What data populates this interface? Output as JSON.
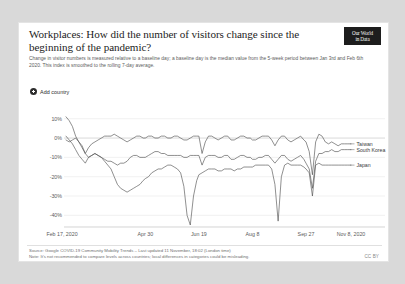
{
  "card": {
    "title": "Workplaces: How did the number of visitors change since the beginning of the pandemic?",
    "subtitle": "Change in visitor numbers is measured relative to a baseline day; a baseline day is the median value from the 5-week period between Jan 3rd and Feb 6th 2020. This index is smoothed to the rolling 7-day average.",
    "logo_line1": "Our World",
    "logo_line2": "in Data",
    "logo_icon": "owid-logo"
  },
  "controls": {
    "add_country_label": "Add country",
    "add_country_icon": "plus-circle-icon"
  },
  "footer": {
    "source": "Source: Google COVID-19 Community Mobility Trends – Last updated 11 November, 18:02 (London time)",
    "note": "Note: It's not recommended to compare levels across countries; local differences in categories could be misleading.",
    "license": "CC BY"
  },
  "chart_data": {
    "type": "line",
    "title": "Workplaces: How did the number of visitors change since the beginning of the pandemic?",
    "xlabel": "",
    "ylabel": "",
    "ylim": [
      -45,
      14
    ],
    "yticks": [
      10,
      0,
      -10,
      -20,
      -30,
      -40
    ],
    "ytick_labels": [
      "10%",
      "0%",
      "-10%",
      "-20%",
      "-30%",
      "-40%"
    ],
    "grid": true,
    "legend_position": "right-inline",
    "x_range": [
      "Feb 17, 2020",
      "Nov 8, 2020"
    ],
    "xticks": [
      0,
      74,
      124,
      174,
      224,
      266
    ],
    "xtick_labels": [
      "Feb 17, 2020",
      "Apr 30",
      "Jun 19",
      "Aug 8",
      "Sep 27",
      "Nov 8, 2020"
    ],
    "unit": "%",
    "series": [
      {
        "name": "Taiwan",
        "label_y": -3,
        "x": [
          0,
          3,
          6,
          9,
          12,
          15,
          18,
          21,
          24,
          27,
          30,
          33,
          36,
          39,
          42,
          45,
          48,
          51,
          54,
          57,
          60,
          63,
          66,
          69,
          72,
          74,
          77,
          80,
          83,
          86,
          89,
          92,
          95,
          98,
          101,
          104,
          107,
          110,
          113,
          116,
          119,
          122,
          124,
          127,
          130,
          133,
          136,
          139,
          142,
          145,
          148,
          151,
          154,
          157,
          160,
          163,
          166,
          169,
          172,
          174,
          177,
          180,
          183,
          186,
          189,
          192,
          195,
          198,
          201,
          204,
          207,
          210,
          213,
          216,
          219,
          222,
          224,
          227,
          230,
          233,
          236,
          239,
          242,
          245,
          248,
          251,
          254,
          257,
          260,
          263,
          266
        ],
        "values": [
          11,
          9,
          6,
          1,
          -2,
          -4,
          -8,
          -5,
          -3,
          -2,
          -1,
          0,
          1,
          1,
          1,
          2,
          1,
          0,
          -1,
          -2,
          -1,
          0,
          1,
          1,
          0,
          0,
          1,
          1,
          0,
          0,
          1,
          1,
          0,
          0,
          1,
          1,
          0,
          -1,
          -1,
          0,
          1,
          1,
          1,
          -8,
          -2,
          1,
          1,
          0,
          -1,
          0,
          1,
          1,
          -1,
          -1,
          0,
          1,
          1,
          0,
          0,
          -1,
          -1,
          0,
          1,
          1,
          1,
          -1,
          -4,
          -1,
          1,
          1,
          -1,
          -2,
          -1,
          0,
          1,
          -1,
          -2,
          -7,
          -19,
          -2,
          2,
          1,
          -2,
          -3,
          -2,
          -3,
          -4,
          -3,
          -3,
          -3,
          -3
        ]
      },
      {
        "name": "South Korea",
        "label_y": -6,
        "x": [
          0,
          3,
          6,
          9,
          12,
          15,
          18,
          21,
          24,
          27,
          30,
          33,
          36,
          39,
          42,
          45,
          48,
          51,
          54,
          57,
          60,
          63,
          66,
          69,
          72,
          74,
          77,
          80,
          83,
          86,
          89,
          92,
          95,
          98,
          101,
          104,
          107,
          110,
          113,
          116,
          119,
          122,
          124,
          127,
          130,
          133,
          136,
          139,
          142,
          145,
          148,
          151,
          154,
          157,
          160,
          163,
          166,
          169,
          172,
          174,
          177,
          180,
          183,
          186,
          189,
          192,
          195,
          198,
          201,
          204,
          207,
          210,
          213,
          216,
          219,
          222,
          224,
          227,
          230,
          233,
          236,
          239,
          242,
          245,
          248,
          251,
          254,
          257,
          260,
          263,
          266
        ],
        "values": [
          1,
          -1,
          -3,
          -6,
          -9,
          -11,
          -13,
          -10,
          -9,
          -8,
          -9,
          -10,
          -11,
          -12,
          -12,
          -13,
          -14,
          -13,
          -13,
          -12,
          -10,
          -9,
          -9,
          -10,
          -10,
          -10,
          -9,
          -8,
          -7,
          -7,
          -8,
          -8,
          -9,
          -9,
          -9,
          -9,
          -9,
          -10,
          -10,
          -9,
          -9,
          -9,
          -9,
          -14,
          -10,
          -9,
          -9,
          -9,
          -10,
          -10,
          -9,
          -9,
          -11,
          -11,
          -10,
          -9,
          -9,
          -10,
          -10,
          -11,
          -11,
          -10,
          -10,
          -9,
          -9,
          -11,
          -13,
          -11,
          -9,
          -9,
          -11,
          -12,
          -11,
          -10,
          -9,
          -11,
          -13,
          -16,
          -26,
          -12,
          -8,
          -8,
          -7,
          -7,
          -6,
          -7,
          -7,
          -6,
          -6,
          -6,
          -6
        ]
      },
      {
        "name": "Japan",
        "label_y": -14,
        "x": [
          0,
          3,
          6,
          9,
          12,
          15,
          18,
          21,
          24,
          27,
          30,
          33,
          36,
          39,
          42,
          45,
          48,
          51,
          54,
          57,
          60,
          63,
          66,
          69,
          72,
          74,
          77,
          80,
          83,
          86,
          89,
          92,
          95,
          98,
          101,
          104,
          107,
          110,
          113,
          116,
          119,
          122,
          124,
          127,
          130,
          133,
          136,
          139,
          142,
          145,
          148,
          151,
          154,
          157,
          160,
          163,
          166,
          169,
          172,
          174,
          177,
          180,
          183,
          186,
          189,
          192,
          195,
          198,
          201,
          204,
          207,
          210,
          213,
          216,
          219,
          222,
          224,
          227,
          230,
          233,
          236,
          239,
          242,
          245,
          248,
          251,
          254,
          257,
          260,
          263,
          266
        ],
        "values": [
          -1,
          -2,
          -1,
          0,
          -2,
          -5,
          -8,
          -10,
          -9,
          -8,
          -9,
          -10,
          -12,
          -14,
          -16,
          -20,
          -24,
          -26,
          -27,
          -28,
          -27,
          -26,
          -25,
          -24,
          -22,
          -21,
          -20,
          -18,
          -17,
          -16,
          -16,
          -15,
          -14,
          -14,
          -15,
          -16,
          -18,
          -25,
          -40,
          -45,
          -30,
          -22,
          -19,
          -18,
          -17,
          -16,
          -16,
          -16,
          -17,
          -17,
          -16,
          -16,
          -16,
          -17,
          -16,
          -16,
          -15,
          -15,
          -15,
          -15,
          -14,
          -14,
          -14,
          -14,
          -14,
          -16,
          -24,
          -43,
          -20,
          -14,
          -13,
          -14,
          -14,
          -14,
          -14,
          -15,
          -16,
          -18,
          -30,
          -14,
          -13,
          -14,
          -14,
          -14,
          -14,
          -14,
          -14,
          -14,
          -14,
          -14,
          -14
        ]
      }
    ]
  }
}
